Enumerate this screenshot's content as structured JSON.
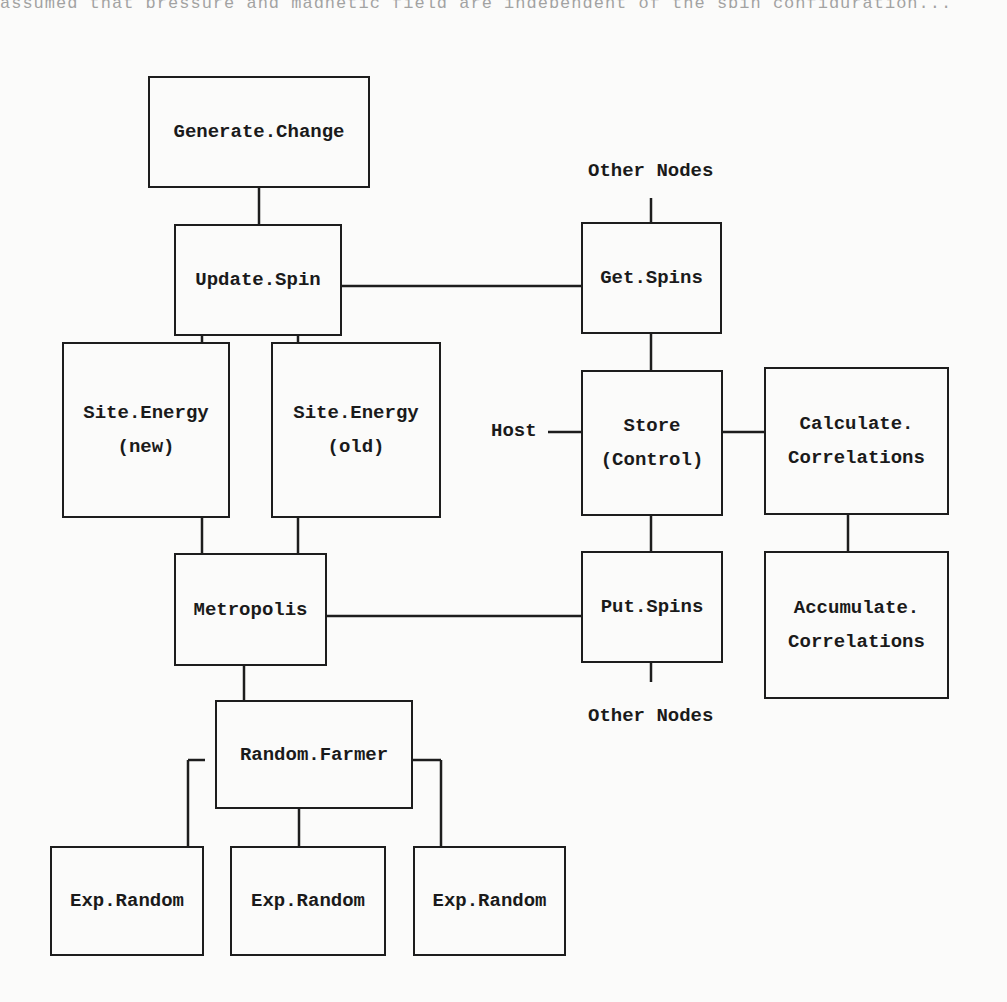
{
  "page": {
    "top_cut_text": "assumed that pressure and magnetic field are independent of the spin configuration..."
  },
  "diagram": {
    "nodes": [
      {
        "id": "generate_change",
        "lines": [
          "Generate.Change"
        ],
        "x": 148,
        "y": 76,
        "w": 222,
        "h": 112
      },
      {
        "id": "update_spin",
        "lines": [
          "Update.Spin"
        ],
        "x": 174,
        "y": 224,
        "w": 168,
        "h": 112
      },
      {
        "id": "site_energy_new",
        "lines": [
          "Site.Energy",
          "(new)"
        ],
        "x": 62,
        "y": 342,
        "w": 168,
        "h": 176
      },
      {
        "id": "site_energy_old",
        "lines": [
          "Site.Energy",
          "(old)"
        ],
        "x": 271,
        "y": 342,
        "w": 170,
        "h": 176
      },
      {
        "id": "metropolis",
        "lines": [
          "Metropolis"
        ],
        "x": 174,
        "y": 553,
        "w": 153,
        "h": 113
      },
      {
        "id": "random_farmer",
        "lines": [
          "Random.Farmer"
        ],
        "x": 215,
        "y": 700,
        "w": 198,
        "h": 109
      },
      {
        "id": "exp_random_1",
        "lines": [
          "Exp.Random"
        ],
        "x": 50,
        "y": 846,
        "w": 154,
        "h": 110
      },
      {
        "id": "exp_random_2",
        "lines": [
          "Exp.Random"
        ],
        "x": 230,
        "y": 846,
        "w": 156,
        "h": 110
      },
      {
        "id": "exp_random_3",
        "lines": [
          "Exp.Random"
        ],
        "x": 413,
        "y": 846,
        "w": 153,
        "h": 110
      },
      {
        "id": "get_spins",
        "lines": [
          "Get.Spins"
        ],
        "x": 581,
        "y": 222,
        "w": 141,
        "h": 112
      },
      {
        "id": "store_control",
        "lines": [
          "Store",
          "(Control)"
        ],
        "x": 581,
        "y": 370,
        "w": 142,
        "h": 146
      },
      {
        "id": "calculate_correlations",
        "lines": [
          "Calculate.",
          "Correlations"
        ],
        "x": 764,
        "y": 367,
        "w": 185,
        "h": 148
      },
      {
        "id": "put_spins",
        "lines": [
          "Put.Spins"
        ],
        "x": 581,
        "y": 551,
        "w": 142,
        "h": 112
      },
      {
        "id": "accumulate_correlations",
        "lines": [
          "Accumulate.",
          "Correlations"
        ],
        "x": 764,
        "y": 551,
        "w": 185,
        "h": 148
      }
    ],
    "labels": [
      {
        "id": "other_nodes_top",
        "text": "Other Nodes",
        "x": 588,
        "y": 160
      },
      {
        "id": "host",
        "text": "Host",
        "x": 491,
        "y": 420
      },
      {
        "id": "other_nodes_bottom",
        "text": "Other Nodes",
        "x": 588,
        "y": 705
      }
    ],
    "edges": [
      {
        "from": "generate_change",
        "to": "update_spin",
        "x1": 259,
        "y1": 188,
        "x2": 259,
        "y2": 224
      },
      {
        "from": "update_spin",
        "to": "get_spins",
        "x1": 342,
        "y1": 286,
        "x2": 581,
        "y2": 286
      },
      {
        "from": "update_spin",
        "to": "site_energy_new",
        "x1": 202,
        "y1": 336,
        "x2": 202,
        "y2": 342
      },
      {
        "from": "update_spin",
        "to": "site_energy_old",
        "x1": 298,
        "y1": 336,
        "x2": 298,
        "y2": 342
      },
      {
        "from": "site_energy_new",
        "to": "metropolis",
        "x1": 202,
        "y1": 518,
        "x2": 202,
        "y2": 553
      },
      {
        "from": "site_energy_old",
        "to": "metropolis",
        "x1": 298,
        "y1": 518,
        "x2": 298,
        "y2": 553
      },
      {
        "from": "metropolis",
        "to": "put_spins",
        "x1": 327,
        "y1": 616,
        "x2": 581,
        "y2": 616
      },
      {
        "from": "metropolis",
        "to": "random_farmer",
        "x1": 244,
        "y1": 666,
        "x2": 244,
        "y2": 700
      },
      {
        "from": "random_farmer",
        "to": "exp_random_1",
        "x1": 188,
        "y1": 760,
        "x2": 205,
        "y2": 760
      },
      {
        "from": "random_farmer",
        "to": "exp_random_1_v",
        "x1": 188,
        "y1": 760,
        "x2": 188,
        "y2": 846
      },
      {
        "from": "random_farmer",
        "to": "exp_random_2",
        "x1": 299,
        "y1": 809,
        "x2": 299,
        "y2": 846
      },
      {
        "from": "random_farmer",
        "to": "exp_random_3",
        "x1": 413,
        "y1": 760,
        "x2": 441,
        "y2": 760
      },
      {
        "from": "random_farmer",
        "to": "exp_random_3_v",
        "x1": 441,
        "y1": 760,
        "x2": 441,
        "y2": 846
      },
      {
        "from": "other_nodes_top",
        "to": "get_spins",
        "x1": 651,
        "y1": 198,
        "x2": 651,
        "y2": 222
      },
      {
        "from": "get_spins",
        "to": "store_control",
        "x1": 651,
        "y1": 334,
        "x2": 651,
        "y2": 370
      },
      {
        "from": "host",
        "to": "store_control",
        "x1": 548,
        "y1": 432,
        "x2": 581,
        "y2": 432
      },
      {
        "from": "store_control",
        "to": "calculate_correlations",
        "x1": 723,
        "y1": 432,
        "x2": 764,
        "y2": 432
      },
      {
        "from": "store_control",
        "to": "put_spins",
        "x1": 651,
        "y1": 516,
        "x2": 651,
        "y2": 551
      },
      {
        "from": "calculate_correlations",
        "to": "accumulate_correlations",
        "x1": 848,
        "y1": 515,
        "x2": 848,
        "y2": 551
      },
      {
        "from": "put_spins",
        "to": "other_nodes_bottom",
        "x1": 651,
        "y1": 663,
        "x2": 651,
        "y2": 682
      }
    ]
  }
}
